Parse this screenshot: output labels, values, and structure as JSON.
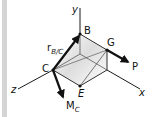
{
  "figure": {
    "axes": {
      "x_label": "x",
      "y_label": "y",
      "z_label": "z"
    },
    "points": {
      "B": "B",
      "G": "G",
      "C": "C",
      "E": "E"
    },
    "vectors": {
      "position_main": "r",
      "position_sub": "B/C",
      "force": "P",
      "moment_main": "M",
      "moment_sub": "C"
    },
    "colors": {
      "line": "#1a1a1a",
      "shade": "#dcdcdc",
      "side_bar": "#d4d4d4"
    }
  }
}
